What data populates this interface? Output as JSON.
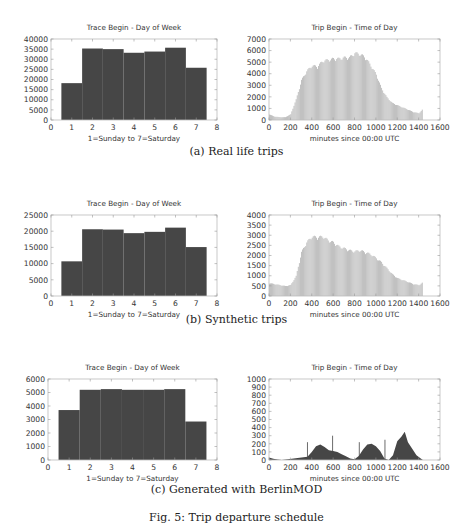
{
  "figure_caption": "Fig. 5: Trip departure schedule",
  "captions": {
    "a": "(a) Real life trips",
    "b": "(b) Synthetic trips",
    "c": "(c) Generated with BerlinMOD"
  },
  "colors": {
    "bar_dark": "#464646",
    "bar_light": "#b4b4b4",
    "frame": "#bbbbbb",
    "text": "#333333"
  },
  "chart_data": [
    {
      "id": "a-day",
      "panel": "a",
      "type": "bar",
      "title": "Trace Begin - Day of Week",
      "xlabel": "1=Sunday to 7=Saturday",
      "ylabel": "",
      "categories": [
        1,
        2,
        3,
        4,
        5,
        6,
        7
      ],
      "values": [
        18200,
        35300,
        35000,
        33200,
        33800,
        35700,
        25800
      ],
      "xlim": [
        0,
        8
      ],
      "ylim": [
        0,
        40000
      ],
      "xticks": [
        0,
        1,
        2,
        3,
        4,
        5,
        6,
        7,
        8
      ],
      "yticks": [
        0,
        5000,
        10000,
        15000,
        20000,
        25000,
        30000,
        35000,
        40000
      ],
      "grid": false,
      "legend": null
    },
    {
      "id": "a-time",
      "panel": "a",
      "type": "bar",
      "title": "Trip Begin - Time of Day",
      "xlabel": "minutes since 00:00 UTC",
      "ylabel": "",
      "x": [
        0,
        50,
        100,
        150,
        200,
        250,
        300,
        350,
        400,
        450,
        500,
        550,
        600,
        650,
        700,
        750,
        800,
        850,
        900,
        950,
        1000,
        1050,
        1100,
        1150,
        1200,
        1250,
        1300,
        1350,
        1400,
        1440
      ],
      "values": [
        500,
        300,
        250,
        250,
        500,
        1800,
        3500,
        4300,
        4800,
        4700,
        5200,
        5300,
        5400,
        5400,
        5500,
        5500,
        5900,
        5800,
        5500,
        4800,
        4000,
        2800,
        2000,
        1500,
        1300,
        1100,
        900,
        700,
        600,
        1000
      ],
      "xlim": [
        0,
        1600
      ],
      "ylim": [
        0,
        7000
      ],
      "xticks": [
        0,
        200,
        400,
        600,
        800,
        1000,
        1200,
        1400,
        1600
      ],
      "yticks": [
        0,
        1000,
        2000,
        3000,
        4000,
        5000,
        6000,
        7000
      ],
      "grid": false,
      "legend": null
    },
    {
      "id": "b-day",
      "panel": "b",
      "type": "bar",
      "title": "Trace Begin - Day of Week",
      "xlabel": "1=Sunday to 7=Saturday",
      "ylabel": "",
      "categories": [
        1,
        2,
        3,
        4,
        5,
        6,
        7
      ],
      "values": [
        10700,
        20600,
        20500,
        19400,
        19800,
        21100,
        15100
      ],
      "xlim": [
        0,
        8
      ],
      "ylim": [
        0,
        25000
      ],
      "xticks": [
        0,
        1,
        2,
        3,
        4,
        5,
        6,
        7,
        8
      ],
      "yticks": [
        0,
        5000,
        10000,
        15000,
        20000,
        25000
      ],
      "grid": false,
      "legend": null
    },
    {
      "id": "b-time",
      "panel": "b",
      "type": "bar",
      "title": "Trip Begin - Time of Day",
      "xlabel": "minutes since 00:00 UTC",
      "ylabel": "",
      "x": [
        0,
        50,
        100,
        150,
        200,
        250,
        300,
        350,
        400,
        450,
        500,
        550,
        600,
        650,
        700,
        750,
        800,
        850,
        900,
        950,
        1000,
        1050,
        1100,
        1150,
        1200,
        1250,
        1300,
        1350,
        1400,
        1440
      ],
      "values": [
        650,
        600,
        550,
        500,
        550,
        1000,
        2200,
        2700,
        3000,
        2950,
        3000,
        2800,
        2700,
        2500,
        2400,
        2300,
        2250,
        2300,
        2200,
        2100,
        1900,
        1700,
        1400,
        1100,
        900,
        800,
        700,
        600,
        550,
        700
      ],
      "xlim": [
        0,
        1600
      ],
      "ylim": [
        0,
        4000
      ],
      "xticks": [
        0,
        200,
        400,
        600,
        800,
        1000,
        1200,
        1400,
        1600
      ],
      "yticks": [
        0,
        500,
        1000,
        1500,
        2000,
        2500,
        3000,
        3500,
        4000
      ],
      "grid": false,
      "legend": null
    },
    {
      "id": "c-day",
      "panel": "c",
      "type": "bar",
      "title": "Trace Begin - Day of Week",
      "xlabel": "1=Sunday to 7=Saturday",
      "ylabel": "",
      "categories": [
        1,
        2,
        3,
        4,
        5,
        6,
        7
      ],
      "values": [
        3700,
        5200,
        5250,
        5200,
        5200,
        5250,
        2850
      ],
      "xlim": [
        0,
        8
      ],
      "ylim": [
        0,
        6000
      ],
      "xticks": [
        0,
        1,
        2,
        3,
        4,
        5,
        6,
        7,
        8
      ],
      "yticks": [
        0,
        1000,
        2000,
        3000,
        4000,
        5000,
        6000
      ],
      "grid": false,
      "legend": null
    },
    {
      "id": "c-time",
      "panel": "c",
      "type": "area",
      "title": "Trip Begin - Time of Day",
      "xlabel": "minutes since 00:00 UTC",
      "ylabel": "",
      "x": [
        0,
        40,
        80,
        120,
        360,
        400,
        440,
        480,
        520,
        560,
        600,
        640,
        680,
        720,
        760,
        800,
        840,
        880,
        920,
        960,
        1000,
        1040,
        1080,
        1120,
        1160,
        1200,
        1240,
        1270,
        1300,
        1340,
        1380,
        1420,
        1440
      ],
      "values": [
        30,
        15,
        5,
        0,
        40,
        100,
        170,
        190,
        160,
        120,
        110,
        100,
        70,
        45,
        20,
        10,
        50,
        130,
        190,
        200,
        170,
        110,
        20,
        0,
        60,
        230,
        290,
        350,
        220,
        140,
        60,
        20,
        0
      ],
      "spikes": [
        {
          "x": 360,
          "y": 220
        },
        {
          "x": 595,
          "y": 300
        },
        {
          "x": 845,
          "y": 220
        },
        {
          "x": 1085,
          "y": 250
        }
      ],
      "xlim": [
        0,
        1600
      ],
      "ylim": [
        0,
        1000
      ],
      "xticks": [
        0,
        200,
        400,
        600,
        800,
        1000,
        1200,
        1400,
        1600
      ],
      "yticks": [
        0,
        100,
        200,
        300,
        400,
        500,
        600,
        700,
        800,
        900,
        1000
      ],
      "grid": false,
      "legend": null
    }
  ]
}
